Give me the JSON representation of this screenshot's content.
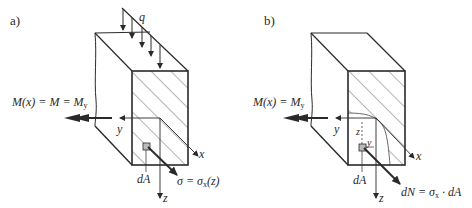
{
  "figure": {
    "panels": [
      {
        "id": "a",
        "label": "a)",
        "load_label": "q",
        "moment_label_main": "M(x) = M = M",
        "moment_label_sub": "y",
        "axis_y": "y",
        "axis_x": "x",
        "axis_z": "z",
        "element_label": "dA",
        "stress_label_main": "σ = σ",
        "stress_label_sub": "x",
        "stress_label_tail": "(z)"
      },
      {
        "id": "b",
        "label": "b)",
        "moment_label_main": "M(x) = M",
        "moment_label_sub": "y",
        "axis_y": "y",
        "axis_x": "x",
        "axis_z": "z",
        "local_z": "z",
        "local_y": "y",
        "element_label": "dA",
        "force_label_main": "dN = σ",
        "force_label_sub": "x",
        "force_label_tail": " · dA"
      }
    ],
    "colors": {
      "line": "#2a2a2a",
      "thin_line": "#444444",
      "background": "#ffffff"
    }
  }
}
